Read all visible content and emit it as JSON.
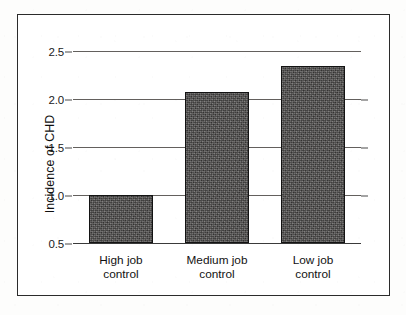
{
  "figure": {
    "frame_border_color": "#2b2b2b",
    "background_color": "#ffffff",
    "bar_fill_color": "#4d4b4a",
    "bar_outline_color": "#131313",
    "gridline_color": "#63605d"
  },
  "chart_data": {
    "type": "bar",
    "title": "",
    "xlabel": "",
    "ylabel": "Incidence of CHD",
    "categories": [
      "High job\ncontrol",
      "Medium job\ncontrol",
      "Low job\ncontrol"
    ],
    "category_lines": [
      [
        "High job",
        "control"
      ],
      [
        "Medium job",
        "control"
      ],
      [
        "Low job",
        "control"
      ]
    ],
    "values": [
      1.0,
      2.07,
      2.34
    ],
    "ylim": [
      0.5,
      2.5
    ],
    "yticks": [
      2.5,
      2.0,
      1.5,
      1.0,
      0.5
    ],
    "ytick_labels": [
      "2.5",
      "2.0",
      "1.5",
      "1.0",
      "0.5"
    ],
    "grid": true,
    "grid_axis": "y",
    "legend": null,
    "legend_position": "none",
    "baseline": 0.5,
    "annotations": []
  }
}
